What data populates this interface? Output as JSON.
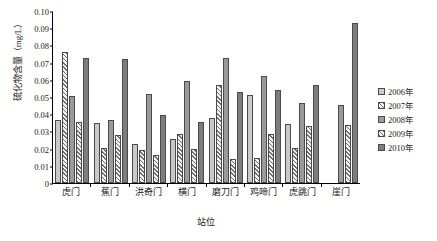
{
  "chart_data": {
    "type": "bar",
    "title": "",
    "xlabel": "站位",
    "ylabel": "硫化物含量（mg/L）",
    "ylim": [
      0,
      0.1
    ],
    "ytick_labels": [
      "0.10",
      "0.09",
      "0.08",
      "0.07",
      "0.06",
      "0.05",
      "0.04",
      "0.03",
      "0.02",
      "0.01",
      "0"
    ],
    "ytick_values": [
      0.1,
      0.09,
      0.08,
      0.07,
      0.06,
      0.05,
      0.04,
      0.03,
      0.02,
      0.01,
      0
    ],
    "grid": false,
    "legend_position": "right",
    "categories": [
      "虎门",
      "蕉门",
      "洪奇门",
      "横门",
      "磨刀门",
      "鸡啼门",
      "虎跳门",
      "崖门"
    ],
    "series": [
      {
        "name": "2006年",
        "fill": "light-gray-solid",
        "color": "#c9c9c9",
        "values": [
          0.0367,
          0.035,
          0.0225,
          0.0255,
          0.038,
          0.051,
          0.0345,
          0.0
        ]
      },
      {
        "name": "2007年",
        "fill": "diagonal-hatch",
        "color": "#6e6e6e",
        "values": [
          0.0762,
          0.0202,
          0.019,
          0.0283,
          0.0572,
          0.0148,
          0.0205,
          0.0
        ]
      },
      {
        "name": "2008年",
        "fill": "medium-gray-solid",
        "color": "#9a9a9a",
        "values": [
          0.0508,
          0.0367,
          0.0515,
          0.0592,
          0.0725,
          0.062,
          0.0465,
          0.0455
        ]
      },
      {
        "name": "2009年",
        "fill": "diagonal-hatch",
        "color": "#6e6e6e",
        "values": [
          0.0355,
          0.0277,
          0.0165,
          0.0195,
          0.014,
          0.0283,
          0.033,
          0.034
        ]
      },
      {
        "name": "2010年",
        "fill": "dark-gray-solid",
        "color": "#7d7d7d",
        "values": [
          0.0727,
          0.0723,
          0.0395,
          0.0352,
          0.053,
          0.054,
          0.057,
          0.093
        ]
      }
    ]
  },
  "legend": {
    "items": [
      {
        "label": "2006年"
      },
      {
        "label": "2007年"
      },
      {
        "label": "2008年"
      },
      {
        "label": "2009年"
      },
      {
        "label": "2010年"
      }
    ]
  }
}
